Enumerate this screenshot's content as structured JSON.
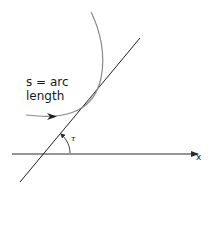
{
  "diagram": {
    "arc_label_line1": "s = arc",
    "arc_label_line2": "length",
    "angle_label": "τ",
    "axis_label": "x",
    "colors": {
      "curve": "#8a8a8a",
      "tangent": "#1f1f1f",
      "axis": "#2a2a2a",
      "text": "#1a1a1a"
    }
  }
}
